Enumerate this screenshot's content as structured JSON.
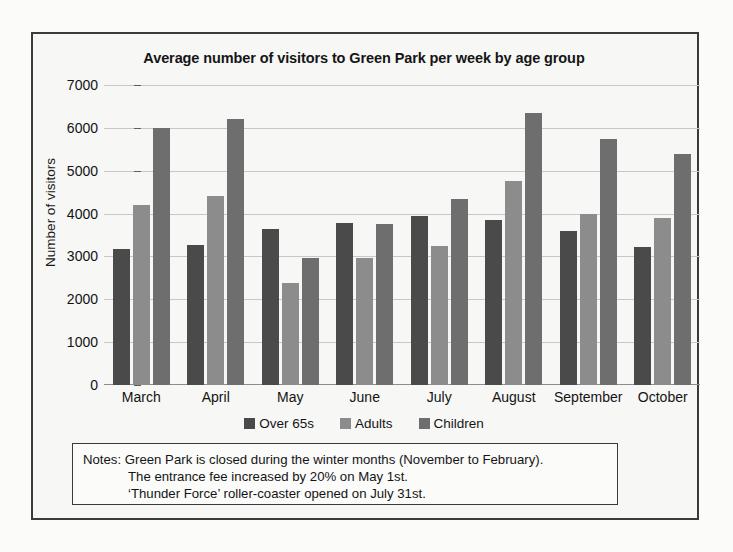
{
  "chart_data": {
    "type": "bar",
    "title": "Average number of visitors to Green Park per week by age group",
    "xlabel": "",
    "ylabel": "Number of visitors",
    "categories": [
      "March",
      "April",
      "May",
      "June",
      "July",
      "August",
      "September",
      "October"
    ],
    "series": [
      {
        "name": "Over 65s",
        "color": "#4a4a4a",
        "values": [
          3180,
          3270,
          3650,
          3770,
          3950,
          3840,
          3600,
          3220
        ]
      },
      {
        "name": "Adults",
        "color": "#8c8c8c",
        "values": [
          4200,
          4400,
          2380,
          2960,
          3250,
          4750,
          4000,
          3900
        ]
      },
      {
        "name": "Children",
        "color": "#6e6e6e",
        "values": [
          6000,
          6200,
          2960,
          3760,
          4350,
          6350,
          5730,
          5400
        ]
      }
    ],
    "ylim": [
      0,
      7000
    ],
    "yticks": [
      0,
      1000,
      2000,
      3000,
      4000,
      5000,
      6000,
      7000
    ],
    "ytick_labels": [
      "0",
      "1000",
      "2000",
      "3000",
      "4000",
      "5000",
      "6000",
      "7000"
    ],
    "grid": true,
    "legend_position": "bottom"
  },
  "notes": {
    "label": "Notes:",
    "lines": [
      "Green Park is closed during the winter months (November to February).",
      "The entrance fee increased by 20% on May 1st.",
      "‘Thunder Force’ roller-coaster opened on July 31st."
    ]
  }
}
